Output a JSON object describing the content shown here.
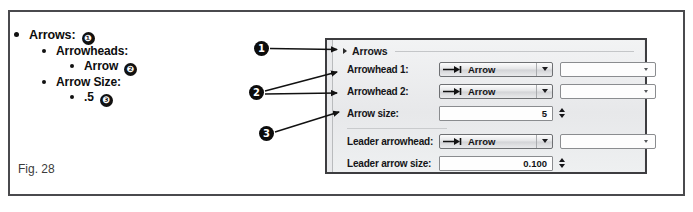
{
  "figure": {
    "caption": "Fig. 28"
  },
  "bullets": [
    {
      "level": 1,
      "text": "Arrows:",
      "callout": "❶"
    },
    {
      "level": 2,
      "text": "Arrowheads:",
      "callout": ""
    },
    {
      "level": 3,
      "text": "Arrow",
      "callout": "❷"
    },
    {
      "level": 2,
      "text": "Arrow Size:",
      "callout": ""
    },
    {
      "level": 3,
      "text": ".5",
      "callout": "❸"
    }
  ],
  "callouts": [
    {
      "id": "1",
      "label": "1"
    },
    {
      "id": "2",
      "label": "2"
    },
    {
      "id": "3",
      "label": "3"
    }
  ],
  "panel": {
    "header": {
      "title": "Arrows",
      "expander_icon": "triangle-collapse-icon"
    },
    "rows": [
      {
        "label": "Arrowhead 1:",
        "combo_value": "Arrow",
        "combo_icon": "arrowhead-start-icon",
        "secondary_value": ""
      },
      {
        "label": "Arrowhead 2:",
        "combo_value": "Arrow",
        "combo_icon": "arrowhead-start-icon",
        "secondary_value": ""
      },
      {
        "label": "Arrow size:",
        "spinner_value": "5"
      },
      {
        "label": "Leader arrowhead:",
        "combo_value": "Arrow",
        "combo_icon": "arrowhead-start-icon",
        "secondary_value": ""
      },
      {
        "label": "Leader arrow size:",
        "spinner_value": "0.100"
      }
    ]
  },
  "colors": {
    "frame_border": "#4a4a4d",
    "panel_border": "#3d3d40",
    "panel_bg": "#e9eaec",
    "callout_bg": "#0c0c0c",
    "text": "#131316"
  }
}
